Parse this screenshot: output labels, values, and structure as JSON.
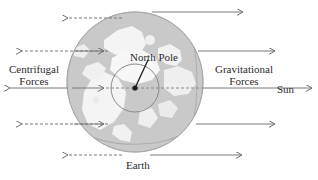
{
  "diagram": {
    "background_color": "#ffffff",
    "ink_color": "#6e6e6e",
    "text_color": "#2b2b2b",
    "ocean_color": "#c9c9c9",
    "land_color": "#f2f2f2",
    "globe_outline_color": "#b0b0b0"
  },
  "labels": {
    "centrifugal_line1": "Centrifugal",
    "centrifugal_line2": "Forces",
    "gravitational_line1": "Gravitational",
    "gravitational_line2": "Forces",
    "sun": "Sun",
    "north_pole": "North Pole",
    "earth": "Earth"
  },
  "arrows": {
    "centrifugal": [
      {
        "row": 1,
        "y": 18,
        "x_tip": 68,
        "x_tail": 122,
        "style": "dashed",
        "direction": "left"
      },
      {
        "row": 2,
        "y": 51,
        "x_tip": 22,
        "x_tail": 108,
        "style": "dashed",
        "direction": "left"
      },
      {
        "row": 3,
        "y": 88,
        "x_tip": 10,
        "x_tail": 68,
        "style": "solid",
        "direction": "left"
      },
      {
        "row": 4,
        "y": 124,
        "x_tip": 22,
        "x_tail": 108,
        "style": "dashed",
        "direction": "left"
      },
      {
        "row": 5,
        "y": 155,
        "x_tip": 68,
        "x_tail": 122,
        "style": "dashed",
        "direction": "left"
      }
    ],
    "gravitational": [
      {
        "row": 1,
        "y": 12,
        "x_tail": 152,
        "x_tip": 243,
        "style": "solid",
        "direction": "right"
      },
      {
        "row": 2,
        "y": 51,
        "x_tail": 198,
        "x_tip": 275,
        "style": "solid",
        "direction": "right"
      },
      {
        "row": 3,
        "y": 88,
        "x_tail": 204,
        "x_tip": 312,
        "style": "solid",
        "direction": "right"
      },
      {
        "row": 4,
        "y": 124,
        "x_tail": 196,
        "x_tip": 275,
        "style": "solid",
        "direction": "right"
      },
      {
        "row": 5,
        "y": 155,
        "x_tail": 150,
        "x_tip": 242,
        "style": "solid",
        "direction": "right"
      }
    ],
    "interior": [
      {
        "row": 2,
        "y": 51,
        "x_tail": 74,
        "x_tip": 104,
        "style": "solid",
        "direction": "right"
      },
      {
        "row": 3,
        "y": 88,
        "x_tail": 72,
        "x_tip": 104,
        "style": "solid",
        "direction": "right"
      },
      {
        "row": 4,
        "y": 124,
        "x_tail": 74,
        "x_tip": 104,
        "style": "solid",
        "direction": "right"
      }
    ],
    "equator_dashed": {
      "y": 88,
      "x_start": 106,
      "x_end": 205,
      "style": "dashed"
    }
  },
  "globe": {
    "center_x": 135,
    "center_y": 82,
    "radius_x": 68,
    "radius_y": 70
  },
  "north_pole_marker": {
    "dot_x": 135,
    "dot_y": 88,
    "arctic_circle_radius": 24,
    "leader_x1": 148,
    "leader_y1": 60
  }
}
